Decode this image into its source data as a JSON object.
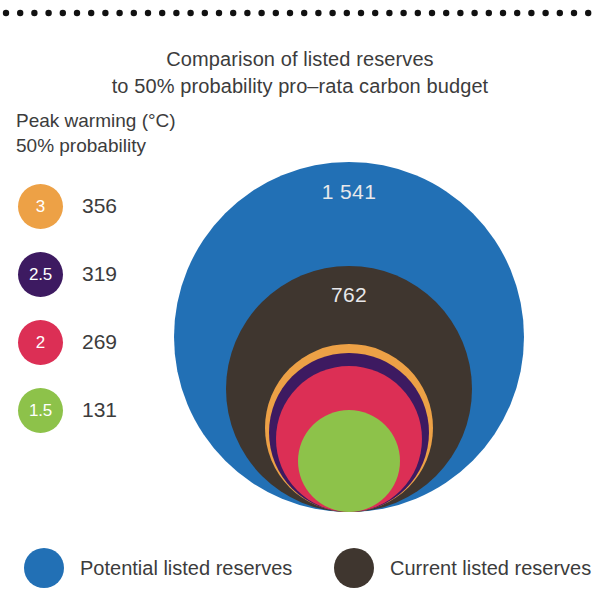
{
  "title": {
    "line1": "Comparison of listed reserves",
    "line2": "to 50% probability pro–rata carbon budget"
  },
  "peak_legend": {
    "header_line1": "Peak warming (°C)",
    "header_line2": "50% probability",
    "items": [
      {
        "label": "3",
        "value": "356",
        "color": "#eda146"
      },
      {
        "label": "2.5",
        "value": "319",
        "color": "#3d1a61"
      },
      {
        "label": "2",
        "value": "269",
        "color": "#dc2f55"
      },
      {
        "label": "1.5",
        "value": "131",
        "color": "#8dc24a"
      }
    ]
  },
  "bubbles": {
    "potential": {
      "name": "Potential listed reserves",
      "value": "1 541",
      "color": "#2270b5"
    },
    "current": {
      "name": "Current listed reserves",
      "value": "762",
      "color": "#3f362f"
    },
    "budget_3": {
      "name": "3 °C budget",
      "value": "356",
      "color": "#eda146"
    },
    "budget_25": {
      "name": "2.5 °C budget",
      "value": "319",
      "color": "#3d1a61"
    },
    "budget_2": {
      "name": "2 °C budget",
      "value": "269",
      "color": "#dc2f55"
    },
    "budget_15": {
      "name": "1.5 °C budget",
      "value": "131",
      "color": "#8dc24a"
    }
  },
  "bottom_legend": {
    "items": [
      {
        "label": "Potential listed reserves",
        "color": "#2270b5"
      },
      {
        "label": "Current listed reserves",
        "color": "#3f362f"
      }
    ]
  },
  "chart_data": {
    "type": "bubble",
    "subtitle": "",
    "unit": "GtCO2",
    "nesting": "concentric, bottom-aligned; bubble area proportional to value",
    "categories": [
      "Potential listed reserves",
      "Current listed reserves",
      "3 °C budget",
      "2.5 °C budget",
      "2 °C budget",
      "1.5 °C budget"
    ],
    "values": [
      1541,
      762,
      356,
      319,
      269,
      131
    ],
    "colors": [
      "#2270b5",
      "#3f362f",
      "#eda146",
      "#3d1a61",
      "#dc2f55",
      "#8dc24a"
    ],
    "labelled_in_figure": [
      "1 541",
      "762"
    ],
    "legend_position": "left (peak warming series) and bottom (reserves series)",
    "grid": false,
    "xlabel": "",
    "ylabel": ""
  }
}
